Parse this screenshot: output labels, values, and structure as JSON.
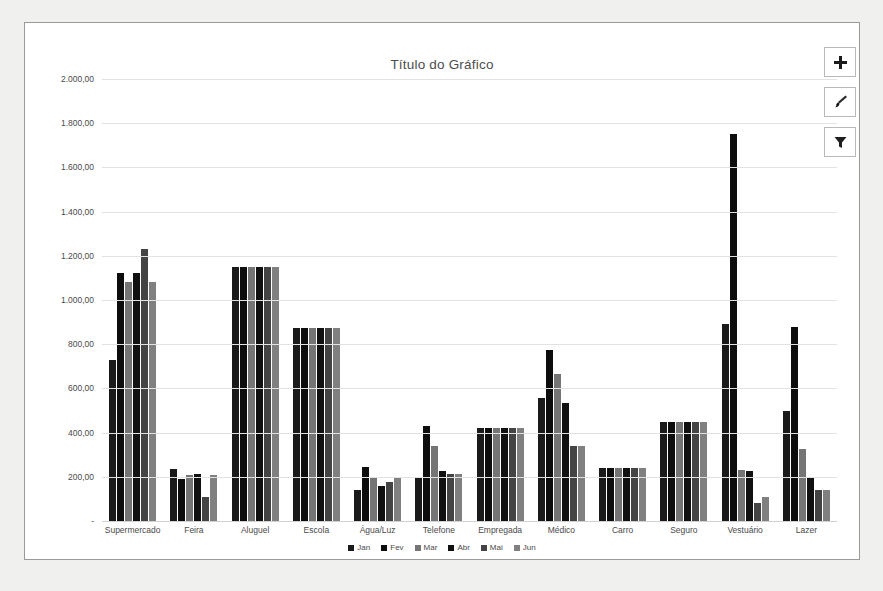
{
  "chart": {
    "title": "Título do Gráfico",
    "buttons": [
      {
        "name": "chart-elements-button",
        "icon": "plus-icon",
        "label": "+"
      },
      {
        "name": "chart-styles-button",
        "icon": "paintbrush-icon",
        "label": ""
      },
      {
        "name": "chart-filters-button",
        "icon": "funnel-icon",
        "label": ""
      }
    ]
  },
  "chart_data": {
    "type": "bar",
    "title": "Título do Gráfico",
    "xlabel": "",
    "ylabel": "",
    "ylim": [
      0,
      2000
    ],
    "grid": true,
    "legend_position": "bottom",
    "ytick_labels": [
      "2.000,00",
      "1.800,00",
      "1.600,00",
      "1.400,00",
      "1.200,00",
      "1.000,00",
      "800,00",
      "600,00",
      "400,00",
      "200,00",
      "-"
    ],
    "ytick_values": [
      2000,
      1800,
      1600,
      1400,
      1200,
      1000,
      800,
      600,
      400,
      200,
      0
    ],
    "categories": [
      "Supermercado",
      "Feira",
      "Aluguel",
      "Escola",
      "Água/Luz",
      "Telefone",
      "Empregada",
      "Médico",
      "Carro",
      "Seguro",
      "Vestuário",
      "Lazer"
    ],
    "series": [
      {
        "name": "Jan",
        "color": "#1a1a1a",
        "values": [
          730,
          235,
          1150,
          875,
          140,
          200,
          420,
          555,
          240,
          450,
          890,
          500
        ]
      },
      {
        "name": "Fev",
        "color": "#0d0d0d",
        "values": [
          1120,
          190,
          1150,
          875,
          245,
          430,
          420,
          775,
          240,
          450,
          1750,
          880
        ]
      },
      {
        "name": "Mar",
        "color": "#757575",
        "values": [
          1080,
          210,
          1150,
          875,
          195,
          340,
          420,
          665,
          240,
          450,
          230,
          325
        ]
      },
      {
        "name": "Abr",
        "color": "#111111",
        "values": [
          1120,
          215,
          1150,
          875,
          160,
          225,
          420,
          535,
          240,
          450,
          225,
          195
        ]
      },
      {
        "name": "Mai",
        "color": "#444444",
        "values": [
          1230,
          110,
          1150,
          875,
          175,
          215,
          420,
          340,
          240,
          450,
          80,
          140
        ]
      },
      {
        "name": "Jun",
        "color": "#808080",
        "values": [
          1080,
          210,
          1150,
          875,
          195,
          215,
          420,
          340,
          240,
          450,
          110,
          140
        ]
      }
    ]
  }
}
